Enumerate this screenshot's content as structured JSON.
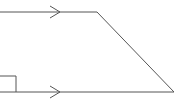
{
  "diagram": {
    "type": "trapezoid",
    "stroke_color": "#555555",
    "background": "#ffffff",
    "top_edge": {
      "x1": 0,
      "y1": 12,
      "x2": 97,
      "y2": 12
    },
    "slanted_edge": {
      "x1": 97,
      "y1": 12,
      "x2": 174,
      "y2": 92
    },
    "bottom_edge": {
      "x1": 0,
      "y1": 92,
      "x2": 174,
      "y2": 92
    },
    "parallel_markers": [
      {
        "edge": "top",
        "x": 60,
        "y": 12
      },
      {
        "edge": "bottom",
        "x": 60,
        "y": 92
      }
    ],
    "right_angle_marker": {
      "x": 0,
      "y": 76,
      "size": 16
    }
  }
}
